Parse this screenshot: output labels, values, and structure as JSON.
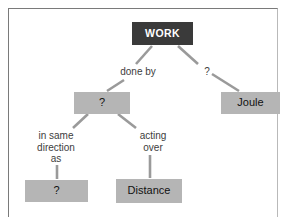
{
  "diagram": {
    "colors": {
      "root_fill": "#3a3a3a",
      "root_text": "#ffffff",
      "node_fill": "#b5b5b5",
      "node_text": "#111111",
      "edge_stroke": "#9a9a9a",
      "label_text": "#3d3d3d",
      "frame_border": "#7a7a7a",
      "background": "#ffffff"
    },
    "nodes": [
      {
        "id": "work",
        "label": "WORK",
        "kind": "root"
      },
      {
        "id": "q_mid",
        "label": "?",
        "kind": "grey"
      },
      {
        "id": "joule",
        "label": "Joule",
        "kind": "grey"
      },
      {
        "id": "q_bottom",
        "label": "?",
        "kind": "grey"
      },
      {
        "id": "distance",
        "label": "Distance",
        "kind": "grey"
      }
    ],
    "edge_labels": [
      {
        "id": "done_by",
        "text": "done by",
        "from": "work",
        "to": "q_mid"
      },
      {
        "id": "q_right",
        "text": "?",
        "from": "work",
        "to": "joule"
      },
      {
        "id": "in_same",
        "text": "in same\ndirection\nas",
        "from": "q_mid",
        "to": "q_bottom"
      },
      {
        "id": "acting",
        "text": "acting\nover",
        "from": "q_mid",
        "to": "distance"
      }
    ]
  }
}
